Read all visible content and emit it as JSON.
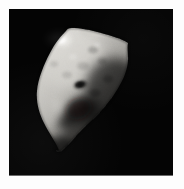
{
  "image": {
    "subject": "asteroid",
    "scene_description": "Grayscale spacecraft photograph of an irregular, angular asteroid lit from the upper left against an empty black sky",
    "orientation": "portrait",
    "canvas": {
      "width_px": 184,
      "height_px": 189
    },
    "matte": {
      "name": "page-background",
      "color": "#fdfdfd",
      "inset_px": 9
    },
    "plate": {
      "name": "photographic-plate",
      "background_color": "#040404",
      "left_px": 9,
      "top_px": 9,
      "width_px": 164,
      "height_px": 167,
      "baseline_color": "#6a6a6a"
    },
    "lighting": {
      "source_direction": "upper-left",
      "terminator_side": "right",
      "highlight_color": "#f2f1ee",
      "midtone_color": "#b9b7b2",
      "shadow_color": "#2b2a29",
      "limb_color": "#0a0a0a"
    },
    "features": [
      {
        "name": "specular-highlight",
        "label": "Bright sunlit ridge crest",
        "center_x_px": 62,
        "center_y_px": 38,
        "tone": "#f4f3f0"
      },
      {
        "name": "bright-limb-sliver",
        "label": "Thin illuminated limb extending to upper right",
        "tip_x_px": 128,
        "tip_y_px": 31,
        "tone": "#d8d6d2"
      },
      {
        "name": "small-dark-crater",
        "label": "Small shadowed crater on mid slope",
        "center_x_px": 81,
        "center_y_px": 85,
        "tone": "#1d1c1b"
      },
      {
        "name": "large-crater-shadow",
        "label": "Large shadowed depression in lower middle",
        "center_x_px": 84,
        "center_y_px": 112,
        "tone": "#262524"
      },
      {
        "name": "lower-tip",
        "label": "Tapered southern tip of the body",
        "x_px": 56,
        "y_px": 150
      }
    ],
    "body_bounds": {
      "left_px": 36,
      "top_px": 27,
      "right_px": 130,
      "bottom_px": 152
    }
  }
}
